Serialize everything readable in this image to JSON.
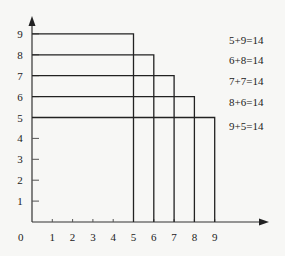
{
  "diagram": {
    "type": "nested-rectangles-on-grid",
    "x_axis": {
      "ticks": [
        "1",
        "2",
        "3",
        "4",
        "5",
        "6",
        "7",
        "8",
        "9"
      ],
      "origin_label": "0"
    },
    "y_axis": {
      "ticks": [
        "1",
        "2",
        "3",
        "4",
        "5",
        "6",
        "7",
        "8",
        "9"
      ]
    },
    "rectangles": [
      {
        "width": 5,
        "height": 9
      },
      {
        "width": 6,
        "height": 8
      },
      {
        "width": 7,
        "height": 7
      },
      {
        "width": 8,
        "height": 6
      },
      {
        "width": 9,
        "height": 5
      }
    ],
    "equations": [
      "5+9=14",
      "6+8=14",
      "7+7=14",
      "8+6=14",
      "9+5=14"
    ],
    "line_color": "#222222"
  }
}
